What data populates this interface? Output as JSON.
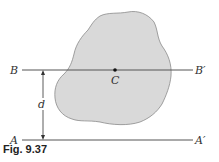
{
  "figure": {
    "caption": "Fig. 9.37",
    "shape": {
      "fill": "#d9d9d9",
      "stroke": "#8a8a8a"
    },
    "line_color": "#555555",
    "labels": {
      "b_left": "B",
      "b_right": "B′",
      "a_left": "A",
      "a_right": "A′",
      "centroid": "C",
      "distance": "d"
    }
  }
}
